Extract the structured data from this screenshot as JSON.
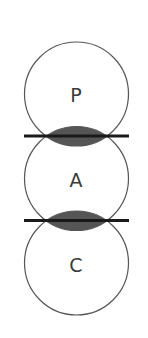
{
  "diagram": {
    "type": "stacked-overlapping-circles",
    "colors": {
      "background": "#ffffff",
      "circle_stroke": "#555555",
      "lens_fill": "#555555",
      "boundary_line": "#1a1a1a",
      "label": "#3a3a3a"
    },
    "circles": [
      {
        "label": "P",
        "cx": 76.5,
        "cy": 94,
        "r": 52
      },
      {
        "label": "A",
        "cx": 76.5,
        "cy": 178.5,
        "r": 52
      },
      {
        "label": "C",
        "cx": 76.5,
        "cy": 263,
        "r": 52
      }
    ],
    "boundaries": [
      {
        "between": [
          "P",
          "A"
        ],
        "y": 136,
        "x1": 24,
        "x2": 129
      },
      {
        "between": [
          "A",
          "C"
        ],
        "y": 220.5,
        "x1": 24,
        "x2": 129
      }
    ]
  }
}
